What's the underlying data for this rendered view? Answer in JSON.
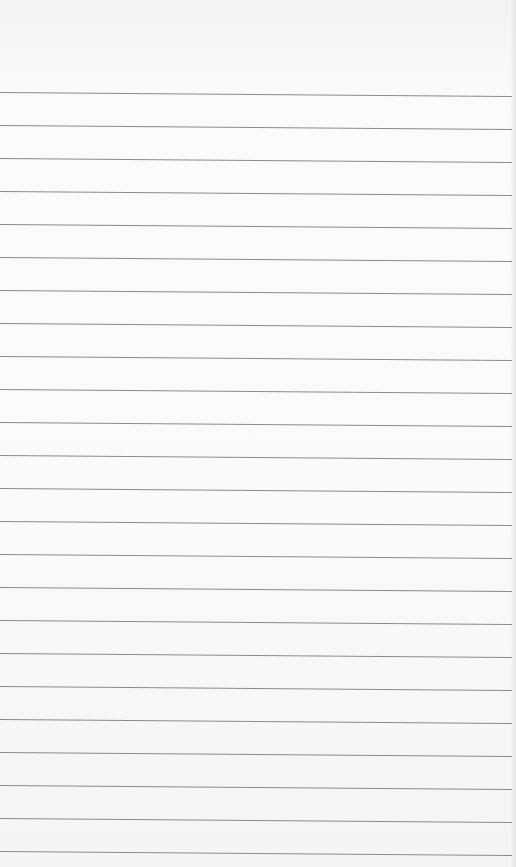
{
  "paper": {
    "type": "lined-paper",
    "text": "",
    "line_color": "#8a8a8a",
    "background_color": "#f9f9f9",
    "rule_positions_px": [
      92,
      125,
      158,
      191,
      224,
      257,
      290,
      323,
      356,
      389,
      422,
      455,
      488,
      521,
      554,
      587,
      620,
      653,
      686,
      719,
      752,
      785,
      818,
      851
    ]
  }
}
